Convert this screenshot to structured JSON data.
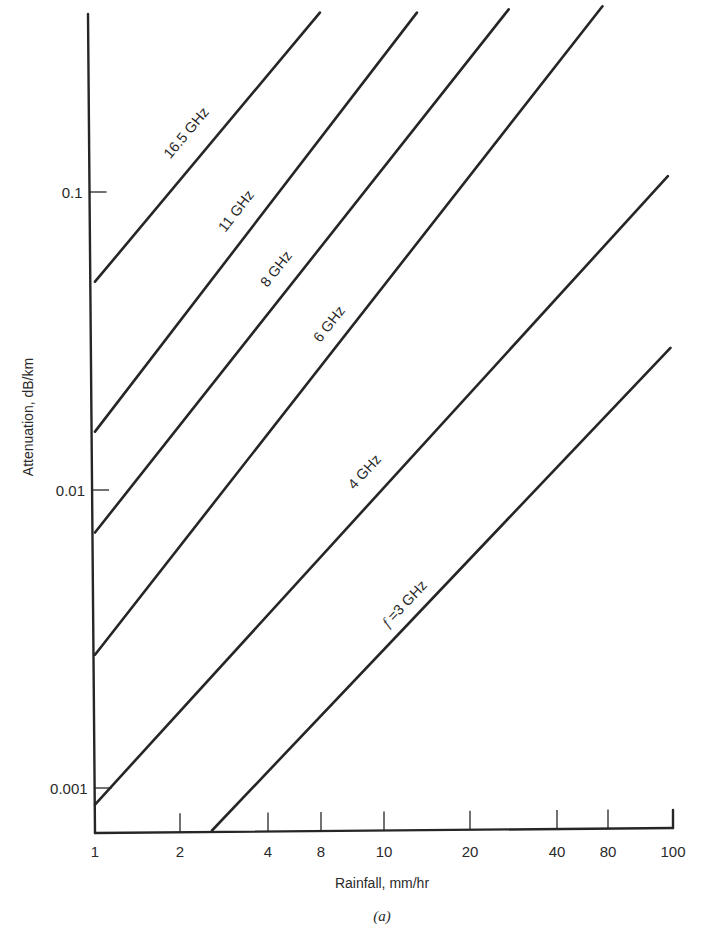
{
  "figure": {
    "caption": "(a)"
  },
  "chart_data": {
    "type": "line",
    "title": "",
    "caption": "(a)",
    "xlabel": "Rainfall, mm/hr",
    "ylabel": "Attenuation, dB/km",
    "xscale": "log",
    "yscale": "log",
    "xlim": [
      1,
      100
    ],
    "ylim": [
      0.00072,
      0.4
    ],
    "grid": false,
    "legend": "none (series labeled inline along lines)",
    "x_tick_labels": [
      "1",
      "2",
      "4",
      "8",
      "10",
      "20",
      "40",
      "80",
      "100"
    ],
    "x_tick_pixel_positions": [
      95,
      180,
      268,
      321,
      384,
      470,
      557,
      608,
      673
    ],
    "y_tick_labels": [
      "0.1",
      "0.01",
      "0.001"
    ],
    "y_tick_values": [
      0.1,
      0.01,
      0.001
    ],
    "series": [
      {
        "name": "16.5 GHz",
        "label": "16.5 GHz",
        "x": [
          1,
          6.0
        ],
        "y": [
          0.05,
          0.4
        ]
      },
      {
        "name": "11 GHz",
        "label": "11 GHz",
        "x": [
          1,
          13.0
        ],
        "y": [
          0.0157,
          0.4
        ]
      },
      {
        "name": "8 GHz",
        "label": "8 GHz",
        "x": [
          1,
          27.0
        ],
        "y": [
          0.0072,
          0.41
        ]
      },
      {
        "name": "6 GHz",
        "label": "6 GHz",
        "x": [
          1,
          57.0
        ],
        "y": [
          0.0028,
          0.42
        ]
      },
      {
        "name": "4 GHz",
        "label": "4 GHz",
        "x": [
          1,
          96.0
        ],
        "y": [
          0.00088,
          0.113
        ]
      },
      {
        "name": "3 GHz",
        "label": "f =3 GHz",
        "x": [
          2.54,
          98.0
        ],
        "y": [
          0.00072,
          0.03
        ]
      }
    ],
    "annotations": [
      {
        "text": "16.5 GHz",
        "x_px": 190,
        "y_px": 136
      },
      {
        "text": "11 GHz",
        "x_px": 240,
        "y_px": 214
      },
      {
        "text": "8 GHz",
        "x_px": 280,
        "y_px": 272
      },
      {
        "text": "6 GHz",
        "x_px": 333,
        "y_px": 327
      },
      {
        "text": "4 GHz",
        "x_px": 368,
        "y_px": 475
      },
      {
        "text": "f =3 GHz",
        "x_px": 408,
        "y_px": 607
      }
    ]
  }
}
